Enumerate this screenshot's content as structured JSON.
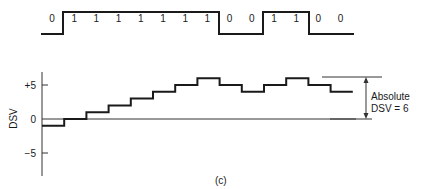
{
  "bit_stream": {
    "bits": [
      "0",
      "1",
      "1",
      "1",
      "1",
      "1",
      "1",
      "1",
      "0",
      "0",
      "1",
      "1",
      "0",
      "0"
    ]
  },
  "chart_data": {
    "type": "line",
    "title": "",
    "xlabel": "",
    "ylabel": "DSV",
    "y_ticks": [
      "+5",
      "0",
      "−5"
    ],
    "ylim": [
      -8,
      7
    ],
    "x": [
      1,
      2,
      3,
      4,
      5,
      6,
      7,
      8,
      9,
      10,
      11,
      12,
      13,
      14
    ],
    "series": [
      {
        "name": "DSV",
        "values": [
          -1,
          0,
          1,
          2,
          3,
          4,
          5,
          6,
          5,
          4,
          5,
          6,
          5,
          4
        ]
      }
    ],
    "annotations": {
      "absolute_dsv_line1": "Absolute",
      "absolute_dsv_line2": "DSV = 6"
    },
    "caption": "(c)"
  }
}
